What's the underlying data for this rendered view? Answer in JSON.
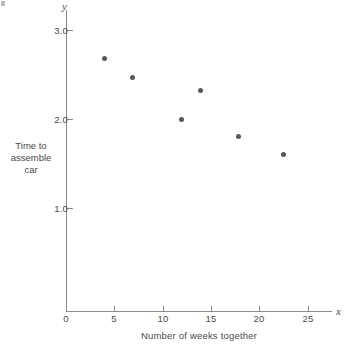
{
  "chart_data": {
    "type": "scatter",
    "title": "",
    "xlabel": "Number of weeks together",
    "ylabel": "Time to assemble car",
    "ylabel_lines": [
      "Time to",
      "assemble",
      "car"
    ],
    "x_axis_symbol": "x",
    "y_axis_symbol": "y",
    "xlim": [
      0,
      27.5
    ],
    "ylim": [
      0,
      3.2
    ],
    "x_ticks": [
      0,
      5,
      10,
      15,
      20,
      25
    ],
    "x_tick_labels": [
      "0",
      "5",
      "10",
      "15",
      "20",
      "25"
    ],
    "y_ticks": [
      1.0,
      2.0,
      3.0
    ],
    "y_tick_labels": [
      "1.0",
      "2.0",
      "3.0"
    ],
    "grid": false,
    "legend": null,
    "marker": "filled-circle",
    "marker_color": "#585858",
    "axis_color": "#8a8a8a",
    "text_color": "#4a4a4a",
    "background": "#ffffff",
    "points": [
      {
        "x": 4,
        "y": 2.68
      },
      {
        "x": 6.9,
        "y": 2.47
      },
      {
        "x": 11.9,
        "y": 2.0
      },
      {
        "x": 13.9,
        "y": 2.32
      },
      {
        "x": 17.8,
        "y": 1.8
      },
      {
        "x": 22.5,
        "y": 1.6
      }
    ]
  }
}
